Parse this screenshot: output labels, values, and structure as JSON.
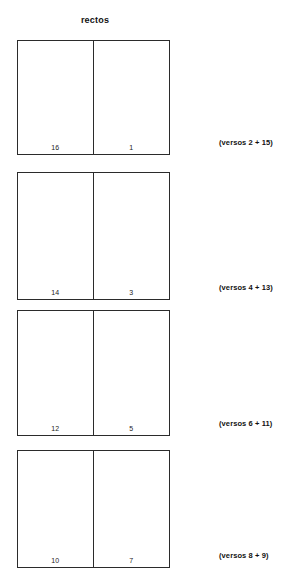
{
  "diagram": {
    "title": "rectos",
    "bifolia": [
      {
        "left_number": "16",
        "right_number": "1",
        "verso_label": "(versos 2 + 15)",
        "top": 40,
        "height": 115,
        "label_top": 138
      },
      {
        "left_number": "14",
        "right_number": "3",
        "verso_label": "(versos 4 + 13)",
        "top": 172,
        "height": 128,
        "label_top": 283
      },
      {
        "left_number": "12",
        "right_number": "5",
        "verso_label": "(versos 6 + 11)",
        "top": 310,
        "height": 126,
        "label_top": 419
      },
      {
        "left_number": "10",
        "right_number": "7",
        "verso_label": "(versos 8 + 9)",
        "top": 450,
        "height": 118,
        "label_top": 551
      }
    ]
  },
  "colors": {
    "stroke": "#2b2b2b",
    "text": "#111111",
    "background": "#ffffff"
  }
}
